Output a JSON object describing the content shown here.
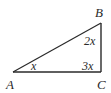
{
  "diagram": {
    "type": "right-triangle",
    "vertices": [
      {
        "id": "A",
        "label": "A"
      },
      {
        "id": "B",
        "label": "B"
      },
      {
        "id": "C",
        "label": "C"
      }
    ],
    "angles": {
      "A": "x",
      "B": "2x",
      "C": "3x"
    },
    "colors": {
      "stroke": "#2a2a2a",
      "background": "#ffffff"
    }
  }
}
